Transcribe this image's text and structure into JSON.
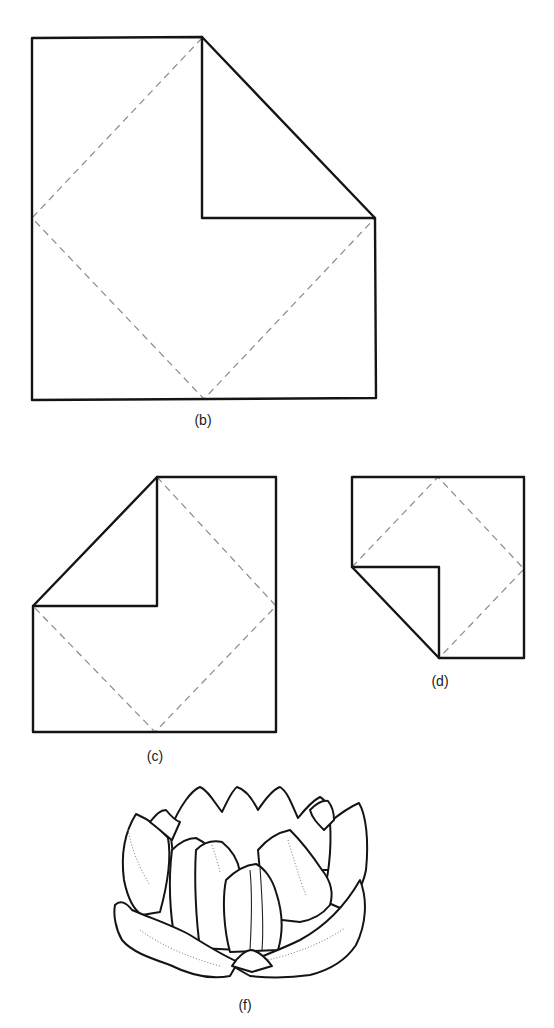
{
  "figure_set": {
    "subject": "Paper folding steps and resulting flower",
    "top_clipped_text": "",
    "panels": [
      {
        "id": "b",
        "label": "(b)",
        "description": "Square with top-right corner folded to center; dashed diamond fold lines"
      },
      {
        "id": "c",
        "label": "(c)",
        "description": "Square with top-left corner folded to center; dashed diamond fold lines"
      },
      {
        "id": "d",
        "label": "(d)",
        "description": "Square with bottom-left corner folded to center; dashed diamond fold lines"
      },
      {
        "id": "f",
        "label": "(f)",
        "description": "Finished folded flower (lotus/water lily) drawing with stippled shading"
      }
    ]
  },
  "colors": {
    "line": "#141414",
    "fold_line": "#8a8a8a",
    "background": "#ffffff"
  }
}
